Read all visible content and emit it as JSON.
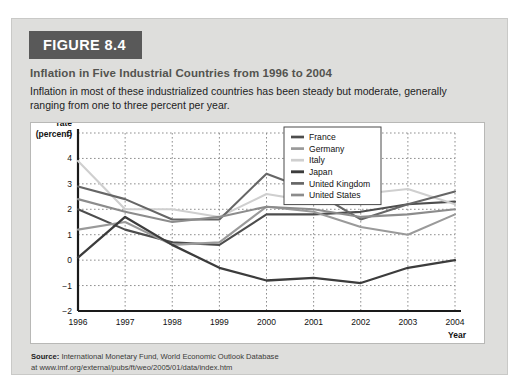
{
  "figure": {
    "badge": "FIGURE 8.4",
    "title": "Inflation in Five Industrial Countries from 1996 to 2004",
    "subtitle": "Inflation in most of these industrialized countries has been steady but moderate, generally ranging from one to three percent per year."
  },
  "source": {
    "label": "Source:",
    "line1": " International Monetary Fund, World Economic Outlook Database",
    "line2": "at www.imf.org/external/pubs/ft/weo/2005/01/data/index.htm"
  },
  "chart_data": {
    "type": "line",
    "title": "Inflation in Five Industrial Countries from 1996 to 2004",
    "xlabel": "Year",
    "ylabel": "Inflation rate (percent)",
    "ylabel_lines": [
      "Inflation",
      "rate",
      "(percent)"
    ],
    "categories": [
      "1996",
      "1997",
      "1998",
      "1999",
      "2000",
      "2001",
      "2002",
      "2003",
      "2004"
    ],
    "x": [
      1996,
      1997,
      1998,
      1999,
      2000,
      2001,
      2002,
      2003,
      2004
    ],
    "yticks": [
      5,
      4,
      3,
      2,
      1,
      0,
      -1,
      -2
    ],
    "ytick_labels": [
      "5",
      "4",
      "3",
      "2",
      "1",
      "0",
      "−1",
      "−2"
    ],
    "ylim": [
      -2,
      5
    ],
    "xlim": [
      1996,
      2004
    ],
    "grid": true,
    "legend_position": "top-right",
    "series": [
      {
        "name": "France",
        "color": "#4d4d4d",
        "width": 2.1,
        "values": [
          2.0,
          1.2,
          0.7,
          0.6,
          1.8,
          1.8,
          1.9,
          2.2,
          2.3
        ]
      },
      {
        "name": "Germany",
        "color": "#9a9a9a",
        "width": 2.1,
        "values": [
          1.2,
          1.5,
          0.6,
          0.7,
          2.1,
          1.9,
          1.3,
          1.0,
          1.8
        ]
      },
      {
        "name": "Italy",
        "color": "#cfcfcf",
        "width": 2.1,
        "values": [
          3.9,
          2.0,
          2.0,
          1.7,
          2.6,
          2.3,
          2.6,
          2.8,
          2.2
        ]
      },
      {
        "name": "Japan",
        "color": "#3c3c3c",
        "width": 2.3,
        "values": [
          0.1,
          1.7,
          0.6,
          -0.3,
          -0.8,
          -0.7,
          -0.9,
          -0.3,
          0.0
        ]
      },
      {
        "name": "United Kingdom",
        "color": "#666666",
        "width": 2.1,
        "values": [
          2.9,
          2.4,
          1.6,
          1.6,
          3.4,
          2.7,
          1.6,
          2.2,
          2.7
        ]
      },
      {
        "name": "United States",
        "color": "#8c8c8c",
        "width": 2.1,
        "values": [
          2.4,
          1.9,
          1.5,
          1.7,
          2.1,
          2.0,
          1.7,
          1.8,
          2.0
        ]
      }
    ]
  }
}
